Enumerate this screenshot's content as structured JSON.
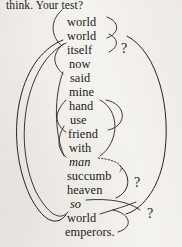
{
  "page": {
    "width": 182,
    "height": 247,
    "background_color": "#f5f3ef",
    "ink_color": "#1b1917"
  },
  "headline": {
    "text": "think. Your test?"
  },
  "word_list": {
    "label": "word-column",
    "items": [
      {
        "text": "world",
        "style": "roman",
        "x": 67,
        "y": 16
      },
      {
        "text": "world",
        "style": "roman",
        "x": 67,
        "y": 30
      },
      {
        "text": "itself",
        "style": "roman",
        "x": 67,
        "y": 44
      },
      {
        "text": "now",
        "style": "roman",
        "x": 69,
        "y": 58
      },
      {
        "text": "said",
        "style": "roman",
        "x": 70,
        "y": 72
      },
      {
        "text": "mine",
        "style": "roman",
        "x": 69,
        "y": 86
      },
      {
        "text": "hand",
        "style": "roman",
        "x": 69,
        "y": 100
      },
      {
        "text": "use",
        "style": "roman",
        "x": 70,
        "y": 114
      },
      {
        "text": "friend",
        "style": "roman",
        "x": 68,
        "y": 128
      },
      {
        "text": "with",
        "style": "roman",
        "x": 69,
        "y": 142
      },
      {
        "text": "man",
        "style": "italic",
        "x": 69,
        "y": 156
      },
      {
        "text": "succumb",
        "style": "roman",
        "x": 67,
        "y": 170
      },
      {
        "text": "heaven",
        "style": "roman",
        "x": 67,
        "y": 184
      },
      {
        "text": "so",
        "style": "italic",
        "x": 70,
        "y": 198
      },
      {
        "text": "world",
        "style": "roman",
        "x": 67,
        "y": 212
      },
      {
        "text": "emperors.",
        "style": "roman",
        "x": 65,
        "y": 226
      }
    ]
  },
  "annotations": {
    "question_marks": [
      {
        "text": "?",
        "x": 121,
        "y": 42
      },
      {
        "text": "?",
        "x": 134,
        "y": 176
      },
      {
        "text": "?",
        "x": 147,
        "y": 207
      }
    ]
  },
  "arc_diagram": {
    "description": "hand-drawn ink arcs linking rhyme words",
    "stroke_color": "#26231f",
    "arcs": [
      {
        "name": "arc-world-itself-bracket-left",
        "d": "M 62,10 C 50,20 50,36 62,46",
        "dashed": false,
        "width": 0.9
      },
      {
        "name": "arc-world-world-right",
        "d": "M 107,17 C 120,22 120,33 107,38",
        "dashed": false,
        "width": 0.9
      },
      {
        "name": "arc-itself-right-brace",
        "d": "M 109,34 C 119,39 119,47 109,52",
        "dashed": false,
        "width": 0.9
      },
      {
        "name": "arc-itself-to-said-left",
        "d": "M 63,44 C 52,54 52,64 63,74",
        "dashed": false,
        "width": 0.9
      },
      {
        "name": "arc-big-outer-left",
        "d": "M 63,40 C 16,58 4,140 30,196 C 42,220 56,228 66,215",
        "dashed": false,
        "width": 1.0
      },
      {
        "name": "arc-big-outer-left-2",
        "d": "M 66,43 C 26,62 12,140 36,192 C 48,214 60,222 68,212",
        "dashed": false,
        "width": 0.9
      },
      {
        "name": "arc-right-outer-big",
        "d": "M 127,36 C 158,52 172,110 164,158 C 158,192 140,210 126,214",
        "dashed": false,
        "width": 1.0
      },
      {
        "name": "arc-said-to-man-left",
        "d": "M 63,72 C 54,96 54,132 64,156",
        "dashed": false,
        "width": 0.9
      },
      {
        "name": "arc-hand-to-friend-right",
        "d": "M 106,100 C 127,104 128,126 108,130",
        "dashed": false,
        "width": 0.9
      },
      {
        "name": "arc-hand-inner-left",
        "d": "M 66,100 C 54,112 54,124 66,132",
        "dashed": false,
        "width": 0.9
      },
      {
        "name": "arc-use-friend-loop-right",
        "d": "M 100,100 C 120,110 120,142 100,156",
        "dashed": false,
        "width": 0.9
      },
      {
        "name": "arc-friend-to-man-left",
        "d": "M 64,126 C 56,140 58,150 66,157",
        "dashed": false,
        "width": 0.9
      },
      {
        "name": "arc-man-dashed-right",
        "d": "M 98,158 C 118,160 124,166 120,172",
        "dashed": true,
        "width": 0.9
      },
      {
        "name": "arc-succumb-heaven-brace",
        "d": "M 120,166 C 132,176 130,192 116,198",
        "dashed": false,
        "width": 1.0
      },
      {
        "name": "arc-so-tail-right",
        "d": "M 86,200 C 110,198 130,202 140,210",
        "dashed": false,
        "width": 0.9
      },
      {
        "name": "arc-world-emperors-brace",
        "d": "M 113,210 C 132,214 133,228 118,232",
        "dashed": false,
        "width": 0.9
      },
      {
        "name": "arc-world-lower-connector",
        "d": "M 100,214 C 116,209 126,206 136,202",
        "dashed": false,
        "width": 0.9
      }
    ]
  }
}
